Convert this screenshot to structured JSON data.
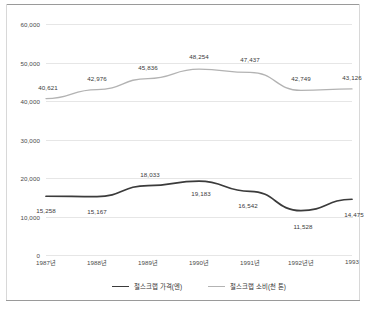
{
  "chart_data": {
    "type": "line",
    "title": "",
    "subtitle": "",
    "xlabel": "",
    "ylabel": "",
    "ylim": [
      0,
      60000
    ],
    "yticks": [
      0,
      10000,
      20000,
      30000,
      40000,
      50000,
      60000
    ],
    "ytick_labels": [
      "0",
      "10,000",
      "20,000",
      "30,000",
      "40,000",
      "50,000",
      "60,000"
    ],
    "grid": true,
    "legend_position": "bottom",
    "categories": [
      "1987년",
      "1988년",
      "1989년",
      "1990년",
      "1991년",
      "1992년년",
      "1993"
    ],
    "series": [
      {
        "name": "철스크랩 가격(엔)",
        "color": "#3b3b3b",
        "values": [
          15258,
          15167,
          18033,
          19183,
          16542,
          11528,
          14475
        ],
        "labels": [
          "15,258",
          "15,167",
          "18,033",
          "19,183",
          "16,542",
          "11,528",
          "14,475"
        ],
        "label_offsets_px": [
          {
            "dx": 0,
            "dy": 14
          },
          {
            "dx": 0,
            "dy": 14
          },
          {
            "dx": 2,
            "dy": -12
          },
          {
            "dx": 2,
            "dy": 12
          },
          {
            "dx": -2,
            "dy": 14
          },
          {
            "dx": 2,
            "dy": 15
          },
          {
            "dx": 2,
            "dy": 15
          }
        ]
      },
      {
        "name": "철스크랩 소비(천 톤)",
        "color": "#b3b3b3",
        "values": [
          40621,
          42976,
          45836,
          48254,
          47437,
          42749,
          43126
        ],
        "labels": [
          "40,621",
          "42,976",
          "45,836",
          "48,254",
          "47,437",
          "42,749",
          "43,126"
        ],
        "label_offsets_px": [
          {
            "dx": 2,
            "dy": -12
          },
          {
            "dx": 0,
            "dy": -12
          },
          {
            "dx": 0,
            "dy": -12
          },
          {
            "dx": 0,
            "dy": -13
          },
          {
            "dx": 0,
            "dy": -13
          },
          {
            "dx": 0,
            "dy": -12
          },
          {
            "dx": 0,
            "dy": -12
          }
        ]
      }
    ]
  },
  "legend": {
    "items": [
      {
        "label": "철스크랩 가격(엔)",
        "swatch": "price"
      },
      {
        "label": "철스크랩 소비(천 톤)",
        "swatch": "consume"
      }
    ]
  },
  "colors": {
    "price_line": "#3b3b3b",
    "consume_line": "#b3b3b3",
    "gridline": "#e6e6e6",
    "axis_text": "#4a4a4a",
    "frame": "#9a9a9a",
    "background": "#ffffff"
  }
}
